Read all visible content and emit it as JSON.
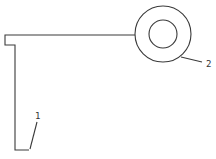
{
  "diagram": {
    "type": "patent-line-drawing",
    "colors": {
      "line": "#3a3a3a",
      "background": "#ffffff"
    },
    "labels": [
      {
        "id": "1",
        "text": "1",
        "refers_to": "L-shaped bracket"
      },
      {
        "id": "2",
        "text": "2",
        "refers_to": "ring / circular eye"
      }
    ]
  }
}
